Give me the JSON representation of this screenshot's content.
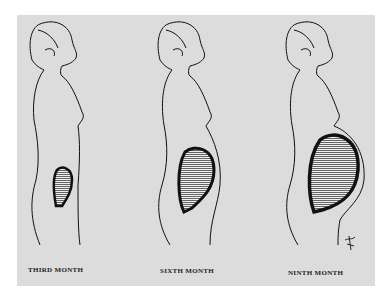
{
  "figure": {
    "background_color": "#dcdcdc",
    "ink_color": "#111111",
    "panels": [
      {
        "label": "THIRD MONTH",
        "stage": "third-month"
      },
      {
        "label": "SIXTH MONTH",
        "stage": "sixth-month"
      },
      {
        "label": "NINTH MONTH",
        "stage": "ninth-month"
      }
    ],
    "signature": "artist-monogram"
  }
}
